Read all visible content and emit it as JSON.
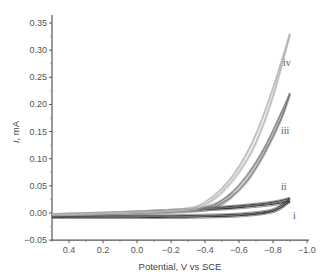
{
  "chart_data": {
    "type": "line",
    "title": "",
    "xlabel": "Potential, V vs SCE",
    "ylabel": "I, mA",
    "xlim": [
      0.5,
      -1.0
    ],
    "ylim": [
      -0.05,
      0.37
    ],
    "x_ticks": [
      "0.4",
      "0.2",
      "0.0",
      "−0.2",
      "−0.4",
      "−0.6",
      "−0.8",
      "−1.0"
    ],
    "y_ticks": [
      "−0.05",
      "0.00",
      "0.05",
      "0.10",
      "0.15",
      "0.20",
      "0.25",
      "0.30",
      "0.35"
    ],
    "grid": false,
    "legend": "inline labels at right",
    "series": [
      {
        "name": "i",
        "color": "#333333",
        "forward": {
          "x": [
            0.5,
            0.2,
            0.0,
            -0.2,
            -0.4,
            -0.6,
            -0.8,
            -0.9
          ],
          "y": [
            -0.006,
            -0.003,
            0.0,
            0.003,
            0.006,
            0.01,
            0.016,
            0.022
          ]
        },
        "reverse": {
          "x": [
            -0.9,
            -0.8,
            -0.6,
            -0.4,
            -0.2,
            0.0,
            0.2,
            0.5
          ],
          "y": [
            0.022,
            0.003,
            -0.005,
            -0.007,
            -0.008,
            -0.008,
            -0.008,
            -0.008
          ]
        }
      },
      {
        "name": "ii",
        "color": "#4a4a4a",
        "forward": {
          "x": [
            0.5,
            0.2,
            0.0,
            -0.2,
            -0.4,
            -0.6,
            -0.8,
            -0.9
          ],
          "y": [
            -0.004,
            -0.001,
            0.002,
            0.005,
            0.009,
            0.013,
            0.02,
            0.027
          ]
        },
        "reverse": {
          "x": [
            -0.9,
            -0.8,
            -0.6,
            -0.4,
            -0.2,
            0.0,
            0.2,
            0.5
          ],
          "y": [
            0.027,
            0.006,
            -0.002,
            -0.004,
            -0.005,
            -0.005,
            -0.005,
            -0.005
          ]
        }
      },
      {
        "name": "iii",
        "color": "#777777",
        "forward": {
          "x": [
            0.5,
            0.0,
            -0.3,
            -0.45,
            -0.55,
            -0.65,
            -0.75,
            -0.85,
            -0.9
          ],
          "y": [
            -0.003,
            0.002,
            0.006,
            0.015,
            0.035,
            0.07,
            0.12,
            0.185,
            0.22
          ]
        },
        "reverse": {
          "x": [
            -0.9,
            -0.85,
            -0.75,
            -0.65,
            -0.55,
            -0.45,
            -0.3,
            0.0,
            0.5
          ],
          "y": [
            0.22,
            0.175,
            0.11,
            0.06,
            0.028,
            0.01,
            0.003,
            0.0,
            -0.003
          ]
        }
      },
      {
        "name": "iv",
        "color": "#b5b5b5",
        "forward": {
          "x": [
            0.5,
            0.0,
            -0.3,
            -0.4,
            -0.5,
            -0.6,
            -0.7,
            -0.8,
            -0.9
          ],
          "y": [
            -0.003,
            0.002,
            0.008,
            0.02,
            0.045,
            0.085,
            0.145,
            0.23,
            0.33
          ]
        },
        "reverse": {
          "x": [
            -0.9,
            -0.8,
            -0.7,
            -0.6,
            -0.5,
            -0.4,
            -0.3,
            0.0,
            0.5
          ],
          "y": [
            0.33,
            0.215,
            0.13,
            0.075,
            0.038,
            0.015,
            0.005,
            0.0,
            -0.003
          ]
        }
      }
    ],
    "annotations": [
      {
        "text": "iv",
        "x": -1.05,
        "y": 0.29
      },
      {
        "text": "iii",
        "x": -1.05,
        "y": 0.15
      },
      {
        "text": "ii",
        "x": -1.05,
        "y": 0.035
      },
      {
        "text": "i",
        "x": -1.05,
        "y": -0.008
      }
    ]
  },
  "labels": {
    "xlabel": "Potential, V vs SCE",
    "ylabel_italic": "I",
    "ylabel_rest": ", mA",
    "curve_i": "i",
    "curve_ii": "ii",
    "curve_iii": "iii",
    "curve_iv": "iv"
  }
}
